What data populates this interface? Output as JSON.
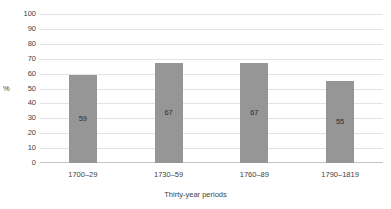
{
  "chart_data": {
    "type": "bar",
    "title": "",
    "categories": [
      "1700–29",
      "1730–59",
      "1760–89",
      "1790–1819"
    ],
    "values": [
      59,
      67,
      67,
      55
    ],
    "data_labels": [
      "59",
      "67",
      "67",
      "55"
    ],
    "xlabel": "Thirty-year periods",
    "ylabel": "%",
    "ylim": [
      0,
      100
    ],
    "ytick_step": 10,
    "yticks": [
      "100",
      "90",
      "80",
      "70",
      "60",
      "50",
      "40",
      "30",
      "20",
      "10",
      "0"
    ],
    "grid": true,
    "legend": "none",
    "bar_color": "#969696",
    "gridline_color": "#e3e3e7",
    "axis_color": "#c3c3c8",
    "text_color": "#3f3f3f",
    "background": "#ffffff"
  }
}
